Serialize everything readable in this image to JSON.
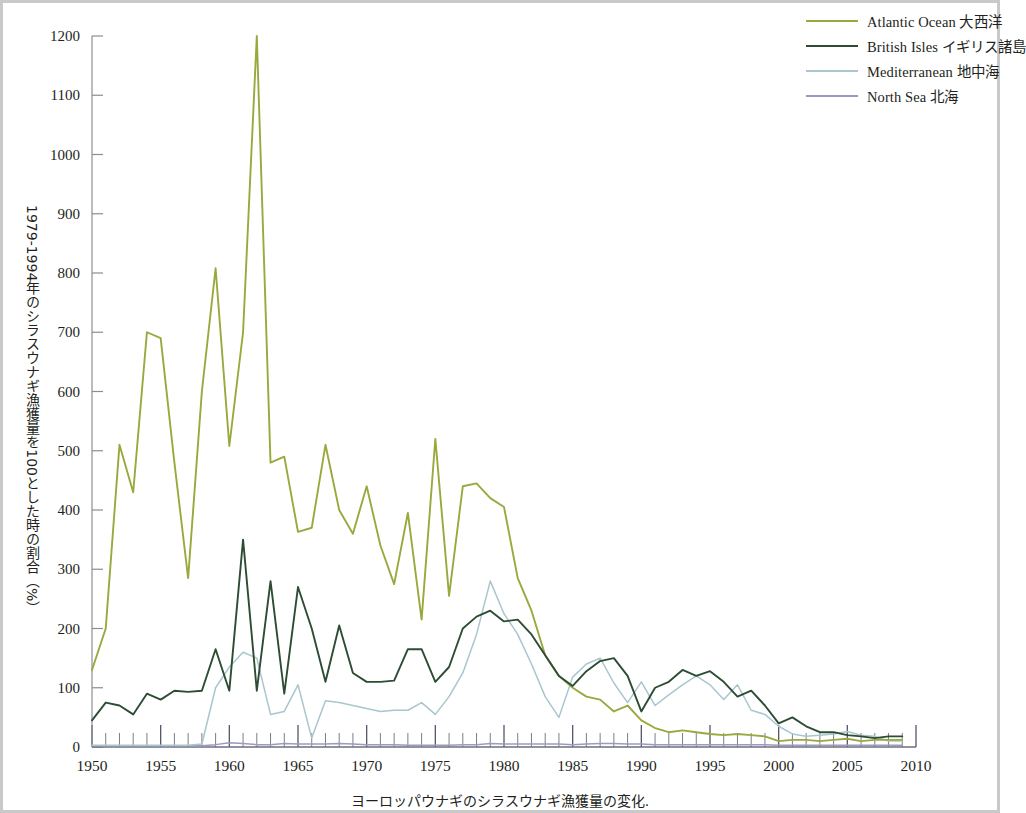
{
  "caption": "ヨーロッパウナギのシラスウナギ漁獲量の変化.",
  "axis": {
    "y_title": "1979-1994年のシラスウナギ漁獲量を100とした時の割合（%）",
    "y_ticks": [
      0,
      100,
      200,
      300,
      400,
      500,
      600,
      700,
      800,
      900,
      1000,
      1100,
      1200
    ],
    "x_ticks": [
      1950,
      1955,
      1960,
      1965,
      1970,
      1975,
      1980,
      1985,
      1990,
      1995,
      2000,
      2005,
      2010
    ],
    "x_min": 1950,
    "x_max": 2010,
    "y_min": 0,
    "y_max": 1200
  },
  "legend": {
    "position": "top-right",
    "items": [
      {
        "label": "Atlantic Ocean  大西洋",
        "name": "Atlantic Ocean",
        "jp": "大西洋",
        "color": "#9ba83d"
      },
      {
        "label": "British Isles  イギリス諸島",
        "name": "British Isles",
        "jp": "イギリス諸島",
        "color": "#2d4c34"
      },
      {
        "label": "Mediterranean  地中海",
        "name": "Mediterranean",
        "jp": "地中海",
        "color": "#a9c6ce"
      },
      {
        "label": "North Sea  北海",
        "name": "North Sea",
        "jp": "北海",
        "color": "#9a9ac4"
      }
    ]
  },
  "chart_data": {
    "type": "line",
    "title": "ヨーロッパウナギのシラスウナギ漁獲量の変化.",
    "xlabel": "",
    "ylabel": "1979-1994年のシラスウナギ漁獲量を100とした時の割合（%）",
    "xlim": [
      1950,
      2010
    ],
    "ylim": [
      0,
      1200
    ],
    "grid": false,
    "legend_position": "top-right",
    "x": [
      1950,
      1951,
      1952,
      1953,
      1954,
      1955,
      1956,
      1957,
      1958,
      1959,
      1960,
      1961,
      1962,
      1963,
      1964,
      1965,
      1966,
      1967,
      1968,
      1969,
      1970,
      1971,
      1972,
      1973,
      1974,
      1975,
      1976,
      1977,
      1978,
      1979,
      1980,
      1981,
      1982,
      1983,
      1984,
      1985,
      1986,
      1987,
      1988,
      1989,
      1990,
      1991,
      1992,
      1993,
      1994,
      1995,
      1996,
      1997,
      1998,
      1999,
      2000,
      2001,
      2002,
      2003,
      2004,
      2005,
      2006,
      2007,
      2008,
      2009
    ],
    "series": [
      {
        "name": "Atlantic Ocean",
        "jp": "大西洋",
        "color": "#9ba83d",
        "values": [
          130,
          200,
          510,
          430,
          700,
          690,
          480,
          285,
          600,
          808,
          508,
          700,
          1200,
          480,
          490,
          363,
          370,
          510,
          400,
          360,
          440,
          340,
          275,
          395,
          215,
          520,
          255,
          440,
          445,
          420,
          405,
          285,
          230,
          155,
          120,
          100,
          85,
          80,
          60,
          70,
          45,
          32,
          25,
          28,
          25,
          22,
          20,
          22,
          20,
          18,
          10,
          12,
          12,
          10,
          12,
          14,
          10,
          12,
          12,
          12
        ]
      },
      {
        "name": "British Isles",
        "jp": "イギリス諸島",
        "color": "#2d4c34",
        "values": [
          45,
          75,
          70,
          55,
          90,
          80,
          95,
          93,
          95,
          165,
          95,
          350,
          95,
          280,
          90,
          270,
          200,
          110,
          205,
          125,
          110,
          110,
          112,
          165,
          165,
          110,
          135,
          200,
          220,
          230,
          212,
          215,
          190,
          155,
          120,
          103,
          128,
          145,
          150,
          120,
          60,
          100,
          110,
          130,
          120,
          128,
          110,
          85,
          95,
          70,
          40,
          50,
          35,
          25,
          25,
          20,
          18,
          15,
          18,
          18
        ]
      },
      {
        "name": "Mediterranean",
        "jp": "地中海",
        "color": "#a9c6ce",
        "values": [
          3,
          3,
          3,
          3,
          3,
          3,
          3,
          3,
          5,
          100,
          135,
          160,
          150,
          55,
          60,
          105,
          15,
          78,
          75,
          70,
          65,
          60,
          62,
          62,
          75,
          55,
          85,
          125,
          190,
          280,
          225,
          190,
          140,
          85,
          50,
          118,
          140,
          150,
          108,
          75,
          110,
          70,
          88,
          105,
          120,
          105,
          80,
          105,
          62,
          55,
          35,
          22,
          18,
          20,
          22,
          26,
          20,
          18,
          10,
          10
        ]
      },
      {
        "name": "North Sea",
        "jp": "北海",
        "color": "#9a9ac4",
        "values": [
          2,
          2,
          2,
          2,
          2,
          2,
          2,
          2,
          2,
          4,
          7,
          6,
          4,
          4,
          6,
          5,
          5,
          5,
          6,
          5,
          4,
          4,
          4,
          3,
          3,
          3,
          3,
          4,
          4,
          6,
          5,
          5,
          5,
          5,
          5,
          4,
          5,
          6,
          6,
          5,
          5,
          4,
          4,
          4,
          4,
          4,
          4,
          4,
          4,
          4,
          3,
          3,
          3,
          3,
          3,
          3,
          3,
          3,
          3,
          3
        ]
      }
    ]
  }
}
